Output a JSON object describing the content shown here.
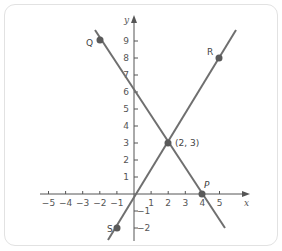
{
  "chart_data": {
    "type": "line",
    "title": "",
    "xlabel": "x",
    "ylabel": "y",
    "xlim": [
      -5,
      5
    ],
    "ylim": [
      -2,
      9
    ],
    "grid": false,
    "x_ticks": [
      -5,
      -4,
      -3,
      -2,
      -1,
      1,
      2,
      3,
      4,
      5
    ],
    "y_ticks": [
      -2,
      -1,
      1,
      2,
      3,
      4,
      5,
      6,
      7,
      8,
      9
    ],
    "x_tick_labels": [
      "−5",
      "−4",
      "−3",
      "−2",
      "−1",
      "1",
      "2",
      "3",
      "4",
      "5"
    ],
    "y_tick_labels": [
      "−2",
      "−1",
      "1",
      "2",
      "3",
      "4",
      "5",
      "6",
      "7",
      "8",
      "9"
    ],
    "series": [
      {
        "name": "Line QP",
        "slope": -1.5,
        "intercept": 6,
        "x": [
          -2,
          2,
          4
        ],
        "y": [
          9,
          3,
          0
        ]
      },
      {
        "name": "Line SR",
        "slope": 1.6667,
        "intercept": -0.3333,
        "x": [
          -1,
          2,
          5
        ],
        "y": [
          -2,
          3,
          8
        ]
      }
    ],
    "points": [
      {
        "label": "Q",
        "x": -2,
        "y": 9
      },
      {
        "label": "R",
        "x": 5,
        "y": 8
      },
      {
        "label": "P",
        "x": 4,
        "y": 0
      },
      {
        "label": "S",
        "x": -1,
        "y": -2
      },
      {
        "label": "(2, 3)",
        "x": 2,
        "y": 3
      }
    ],
    "annotations": [
      "(2, 3)"
    ]
  },
  "labels": {
    "x_axis": "x",
    "y_axis": "y",
    "Q": "Q",
    "R": "R",
    "P": "P",
    "S": "S",
    "intersection": "(2, 3)"
  },
  "colors": {
    "line": "#6f6f6f",
    "point": "#5a5a5a",
    "axis": "#555555",
    "border": "#e2e2e2"
  }
}
